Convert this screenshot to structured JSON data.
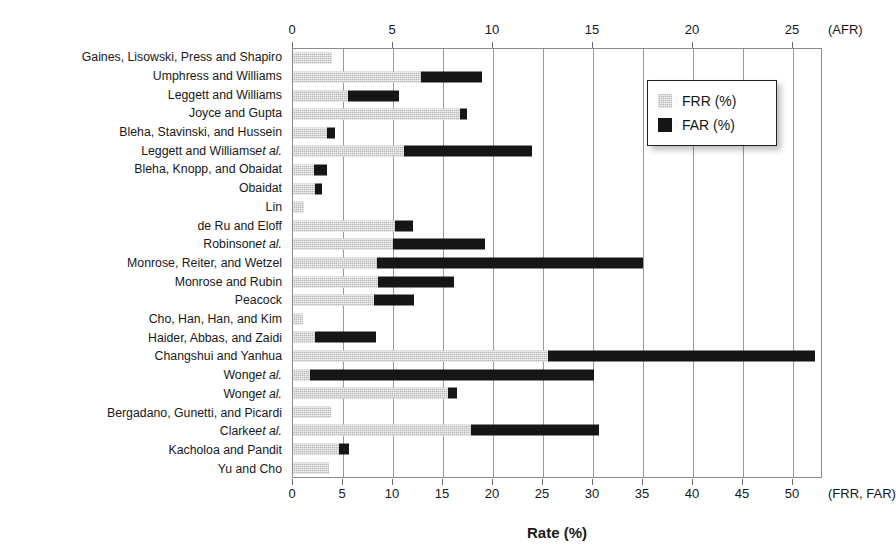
{
  "chart_data": {
    "type": "bar",
    "orientation": "horizontal",
    "title": "",
    "xlabel": "Rate (%)",
    "ylabel": "Authors",
    "grid": true,
    "legend_position": "top-right",
    "top_axis": {
      "unit_label": "(AFR)",
      "ticks": [
        0,
        5,
        10,
        15,
        20,
        25
      ],
      "tick_labels": [
        "0",
        "5",
        "10",
        "15",
        "20",
        "25"
      ],
      "range": [
        0,
        26.5
      ]
    },
    "bottom_axis": {
      "unit_label": "(FRR, FAR)",
      "ticks": [
        0,
        5,
        10,
        15,
        20,
        25,
        30,
        35,
        40,
        45,
        50
      ],
      "tick_labels": [
        "0",
        "5",
        "10",
        "15",
        "20",
        "25",
        "30",
        "35",
        "40",
        "45",
        "50"
      ],
      "range": [
        0,
        53
      ]
    },
    "legend": [
      {
        "name": "FRR (%)",
        "color": "#b9b9b9"
      },
      {
        "name": "FAR (%)",
        "color": "#161616"
      }
    ],
    "categories": [
      "Gaines, Lisowski, Press and Shapiro",
      "Umphress and Williams",
      "Leggett and Williams",
      "Joyce and Gupta",
      "Bleha, Stavinski, and Hussein",
      "Leggett and Williams et al.",
      "Bleha, Knopp, and Obaidat",
      "Obaidat",
      "Lin",
      "de Ru and Eloff",
      "Robinson et al.",
      "Monrose, Reiter, and Wetzel",
      "Monrose and Rubin",
      "Peacock",
      "Cho, Han, Han, and Kim",
      "Haider, Abbas, and Zaidi",
      "Changshui and Yanhua",
      "Wong et al.",
      "Wong et al.",
      "Bergadano, Gunetti, and Picardi",
      "Clarke et al.",
      "Kacholoa and Pandit",
      "Yu and Cho"
    ],
    "series": [
      {
        "name": "FRR (%)",
        "color": "#b9b9b9",
        "values": [
          3.9,
          12.8,
          5.5,
          16.7,
          3.4,
          11.1,
          2.1,
          2.2,
          1.1,
          10.2,
          10.0,
          8.4,
          8.5,
          8.1,
          1.0,
          2.2,
          25.5,
          1.7,
          15.5,
          3.8,
          17.8,
          4.6,
          3.6
        ]
      },
      {
        "name": "FAR (%)",
        "color": "#161616",
        "values": [
          0.0,
          18.9,
          10.6,
          17.4,
          4.2,
          23.9,
          3.4,
          2.9,
          0.0,
          12.0,
          19.2,
          35.0,
          16.1,
          12.1,
          0.0,
          8.3,
          52.2,
          30.1,
          16.4,
          0.0,
          30.6,
          5.6,
          0.0
        ]
      }
    ]
  }
}
